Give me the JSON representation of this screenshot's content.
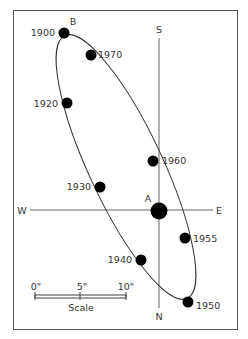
{
  "diagram": {
    "type": "binary-star-orbit",
    "compass": {
      "north": "N",
      "south": "S",
      "east": "E",
      "west": "W"
    },
    "primary_star": {
      "label": "A"
    },
    "orbit_marker": {
      "label": "B"
    },
    "positions": [
      {
        "year": "1900"
      },
      {
        "year": "1970"
      },
      {
        "year": "1920"
      },
      {
        "year": "1930"
      },
      {
        "year": "1960"
      },
      {
        "year": "1955"
      },
      {
        "year": "1940"
      },
      {
        "year": "1950"
      }
    ],
    "scale": {
      "title": "Scale",
      "ticks": [
        "0\"",
        "5\"",
        "10\""
      ]
    }
  }
}
